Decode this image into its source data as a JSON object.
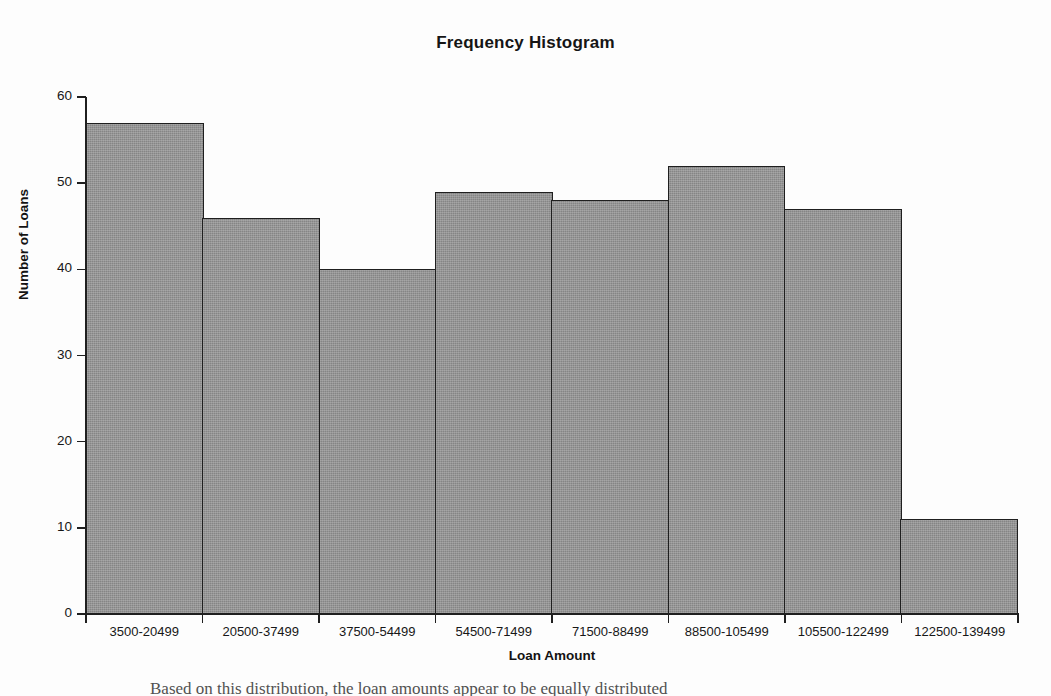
{
  "chart_data": {
    "type": "bar",
    "title": "Frequency Histogram",
    "xlabel": "Loan Amount",
    "ylabel": "Number of Loans",
    "categories": [
      "3500-20499",
      "20500-37499",
      "37500-54499",
      "54500-71499",
      "71500-88499",
      "88500-105499",
      "105500-122499",
      "122500-139499"
    ],
    "values": [
      57,
      46,
      40,
      49,
      48,
      52,
      47,
      11
    ],
    "ylim": [
      0,
      60
    ],
    "yticks": [
      0,
      10,
      20,
      30,
      40,
      50,
      60
    ],
    "grid": false,
    "legend": false,
    "bar_fill_color": "#858585",
    "bar_edge_color": "#1f1f1f",
    "axis_color": "#1f1f1f",
    "background_color": "#fdfdfd"
  },
  "footer": {
    "clipped_text": "Based on this distribution, the loan amounts appear to be equally distributed"
  }
}
